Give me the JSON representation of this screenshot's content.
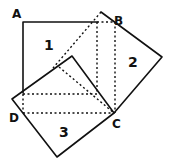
{
  "diagram": {
    "points": {
      "A": "A",
      "B": "B",
      "C": "C",
      "D": "D"
    },
    "regions": {
      "square1": "1",
      "square2": "2",
      "square3": "3"
    },
    "colors": {
      "line": "#111111",
      "background": "#ffffff"
    }
  }
}
